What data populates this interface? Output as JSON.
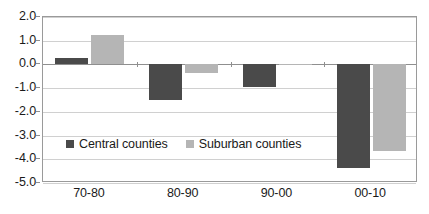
{
  "chart_data": {
    "type": "bar",
    "title": "",
    "subtitle": "",
    "xlabel": "",
    "ylabel": "",
    "categories": [
      "70-80",
      "80-90",
      "90-00",
      "00-10"
    ],
    "series": [
      {
        "name": "Central counties",
        "color": "#4a4a4a",
        "values": [
          0.28,
          -1.48,
          -0.95,
          -4.35
        ]
      },
      {
        "name": "Suburban counties",
        "color": "#b5b5b5",
        "values": [
          1.25,
          -0.35,
          0.03,
          -3.67
        ]
      }
    ],
    "ylim": [
      -5.0,
      2.0
    ],
    "ytick_labels": [
      "2.0",
      "1.0",
      "0.0",
      "-1.0",
      "-2.0",
      "-3.0",
      "-4.0",
      "-5.0"
    ],
    "ytick_values": [
      2.0,
      1.0,
      0.0,
      -1.0,
      -2.0,
      -3.0,
      -4.0,
      -5.0
    ],
    "grid": true,
    "grid_axis": "y",
    "legend_position": "inside-lower-left",
    "zero_line": 0.0,
    "plot_border_color": "#9a9a9a",
    "gridline_color": "#d0d0d0",
    "background_color": "#ffffff",
    "text_color": "#1a1a1a"
  }
}
